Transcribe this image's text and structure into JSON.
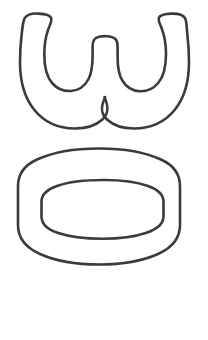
{
  "page": {
    "background_color": "#ffffff",
    "width": 208,
    "height": 340
  },
  "artwork": {
    "kind": "hand-drawn letterform outlines",
    "stroke_color": "#3b3b3b",
    "fill_color": "none",
    "stroke_width": 2.6,
    "glyphs": [
      {
        "id": "glyph-w",
        "character": "w",
        "case": "lowercase",
        "description": "lowercase w drawn as a single closed outline with two rounded bowls, a central inverted-U arch and a sharp V junction at the bottom centre",
        "bounds": {
          "x": 17,
          "y": 13,
          "width": 173,
          "height": 117
        },
        "counters": 2
      },
      {
        "id": "glyph-o",
        "character": "o",
        "case": "lowercase",
        "description": "lowercase o drawn as a wide rounded oval outline with a smaller concentric oval counter inside",
        "bounds": {
          "x": 18,
          "y": 148,
          "width": 162,
          "height": 117
        },
        "counters": 1
      }
    ]
  },
  "blank_area": {
    "label": "empty lower margin",
    "x": 0,
    "y": 272,
    "width": 208,
    "height": 68
  }
}
